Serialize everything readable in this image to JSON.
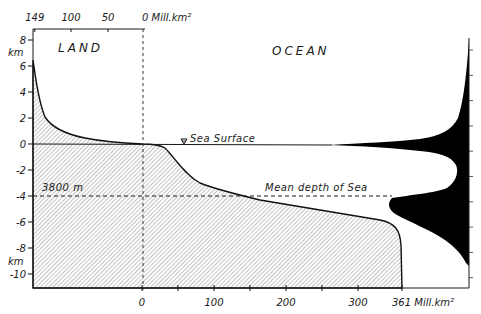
{
  "figure": {
    "region_labels": {
      "land": "LAND",
      "ocean": "OCEAN"
    },
    "top_axis": {
      "ticks": [
        {
          "label": "149",
          "value": 149
        },
        {
          "label": "100",
          "value": 100
        },
        {
          "label": "50",
          "value": 50
        }
      ],
      "zero_label": "0 Mill.km²"
    },
    "bottom_axis": {
      "ticks": [
        {
          "label": "0",
          "value": 0
        },
        {
          "label": "",
          "value": 50
        },
        {
          "label": "100",
          "value": 100
        },
        {
          "label": "",
          "value": 150
        },
        {
          "label": "200",
          "value": 200
        },
        {
          "label": "",
          "value": 250
        },
        {
          "label": "300",
          "value": 300
        }
      ],
      "end_label": "361 Mill.km²",
      "end_value": 361
    },
    "left_axis": {
      "unit_label_top": "km",
      "unit_label_bottom": "km",
      "ticks": [
        {
          "label": "8",
          "value": 8
        },
        {
          "label": "6",
          "value": 6
        },
        {
          "label": "4",
          "value": 4
        },
        {
          "label": "2",
          "value": 2
        },
        {
          "label": "0",
          "value": 0
        },
        {
          "label": "-2",
          "value": -2
        },
        {
          "label": "-4",
          "value": -4
        },
        {
          "label": "-6",
          "value": -6
        },
        {
          "label": "-8",
          "value": -8
        },
        {
          "label": "-10",
          "value": -10
        }
      ]
    },
    "annotations": {
      "sea_surface": "Sea Surface",
      "mean_depth": "Mean depth of Sea",
      "mean_depth_value": "3800 m",
      "mean_depth_km": -3.8
    },
    "hypsographic_curve": {
      "description": "Cumulative area (Mill. km²) above each elevation; land area measured leftward from 0 (to 149), ocean area rightward from 0 (to 361)",
      "land_points_area_elev": [
        [
          149,
          6.5
        ],
        [
          146,
          5.5
        ],
        [
          143,
          3.5
        ],
        [
          138,
          2
        ],
        [
          117,
          1
        ],
        [
          80,
          0.4
        ],
        [
          40,
          0.1
        ],
        [
          0,
          0
        ]
      ],
      "ocean_points_area_elev": [
        [
          0,
          0
        ],
        [
          25,
          -0.1
        ],
        [
          57,
          -2
        ],
        [
          80,
          -3
        ],
        [
          150,
          -4
        ],
        [
          260,
          -5
        ],
        [
          340,
          -5.4
        ],
        [
          358,
          -6
        ],
        [
          361,
          -7
        ],
        [
          361,
          -11
        ]
      ]
    },
    "depth_distribution": {
      "description": "Frequency distribution of Earth's surface elevation (black profile on right); peaks near sea level and near -4.5 km"
    }
  }
}
